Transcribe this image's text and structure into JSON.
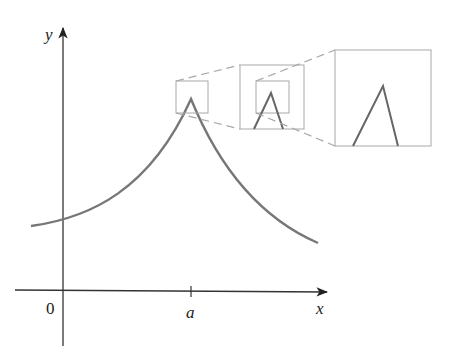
{
  "figure": {
    "axes": {
      "x_label": "x",
      "y_label": "y",
      "origin_label": "0",
      "tick_label": "a"
    },
    "colors": {
      "axis": "#333333",
      "curve": "#777777",
      "box": "#a8a8a8",
      "dash": "#a8a8a8",
      "text": "#222222"
    },
    "zoom_levels": [
      {
        "name": "original-view-box",
        "magnification": 1
      },
      {
        "name": "first-zoom",
        "magnification": 2
      },
      {
        "name": "second-zoom",
        "magnification": 3
      }
    ]
  }
}
